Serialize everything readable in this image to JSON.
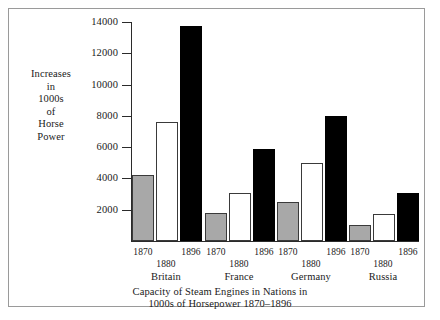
{
  "figure": {
    "axis_title_lines": [
      "Increases",
      "in",
      "1000s",
      "of",
      "Horse",
      "Power"
    ],
    "caption_lines": [
      "Capacity of Steam Engines in Nations in",
      "1000s of Horsepower 1870–1896"
    ],
    "colors": {
      "bar_1870": "#a8a8a8",
      "bar_1880": "#ffffff",
      "bar_1896": "#000000",
      "axis": "#2b2b2b",
      "frame": "#9a9a9a",
      "background": "#ffffff"
    }
  },
  "chart_data": {
    "type": "bar",
    "xlabel": "",
    "ylabel": "Increases in 1000s of Horse Power",
    "ylim": [
      0,
      14000
    ],
    "ytick_labels": [
      "14000",
      "12000",
      "10000",
      "8000",
      "6000",
      "4000",
      "2000"
    ],
    "ytick_values": [
      14000,
      12000,
      10000,
      8000,
      6000,
      4000,
      2000
    ],
    "ytick_step": 2000,
    "grid": false,
    "legend_position": "none",
    "categories": [
      "Britain",
      "France",
      "Germany",
      "Russia"
    ],
    "series": [
      {
        "name": "1870",
        "color": "#a8a8a8",
        "values": [
          4200,
          1800,
          2500,
          1000
        ]
      },
      {
        "name": "1880",
        "color": "#ffffff",
        "values": [
          7600,
          3100,
          5000,
          1700
        ]
      },
      {
        "name": "1896",
        "color": "#000000",
        "values": [
          13750,
          5900,
          8000,
          3100
        ]
      }
    ],
    "groups": [
      {
        "country": "Britain",
        "bars": [
          {
            "year": "1870",
            "value": 4200,
            "style": "gray"
          },
          {
            "year": "1880",
            "value": 7600,
            "style": "white"
          },
          {
            "year": "1896",
            "value": 13750,
            "style": "black"
          }
        ]
      },
      {
        "country": "France",
        "bars": [
          {
            "year": "1870",
            "value": 1800,
            "style": "gray"
          },
          {
            "year": "1880",
            "value": 3100,
            "style": "white"
          },
          {
            "year": "1896",
            "value": 5900,
            "style": "black"
          }
        ]
      },
      {
        "country": "Germany",
        "bars": [
          {
            "year": "1870",
            "value": 2500,
            "style": "gray"
          },
          {
            "year": "1880",
            "value": 5000,
            "style": "white"
          },
          {
            "year": "1896",
            "value": 8000,
            "style": "black"
          }
        ]
      },
      {
        "country": "Russia",
        "bars": [
          {
            "year": "1870",
            "value": 1000,
            "style": "gray"
          },
          {
            "year": "1880",
            "value": 1700,
            "style": "white"
          },
          {
            "year": "1896",
            "value": 3100,
            "style": "black"
          }
        ]
      }
    ]
  }
}
